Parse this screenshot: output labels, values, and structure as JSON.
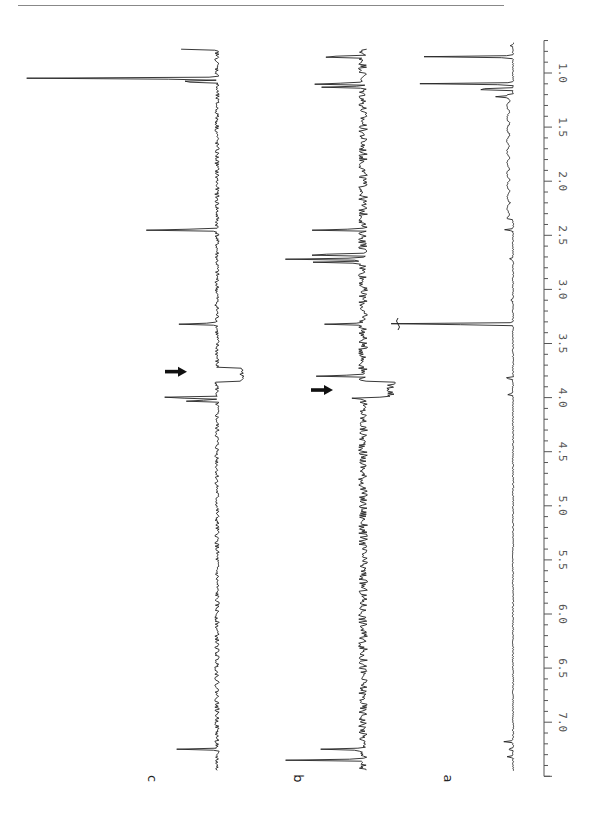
{
  "page": {
    "top_rule": true
  },
  "chart_data": {
    "type": "line",
    "title": "",
    "orientation": "rotated-90 (chemical shift runs top-to-bottom, intensity extends leftward)",
    "xlabel": "",
    "ylabel": "",
    "axis": {
      "unit": "ppm",
      "range": [
        0.7,
        7.5
      ],
      "major_ticks": [
        1.0,
        1.5,
        2.0,
        2.5,
        3.0,
        3.5,
        4.0,
        4.5,
        5.0,
        5.5,
        6.0,
        6.5,
        7.0
      ],
      "tick_labels": [
        "1.0",
        "1.5",
        "2.0",
        "2.5",
        "3.0",
        "3.5",
        "4.0",
        "4.5",
        "5.0",
        "5.5",
        "6.0",
        "6.5",
        "7.0"
      ],
      "minor_tick_step": 0.1
    },
    "grid": false,
    "legend": null,
    "series": [
      {
        "name": "a",
        "label": "a",
        "noise": "low",
        "peaks": [
          {
            "ppm": 0.75,
            "height": 0.02
          },
          {
            "ppm": 0.85,
            "height": 0.58
          },
          {
            "ppm": 1.1,
            "height": 0.62
          },
          {
            "ppm": 1.15,
            "height": 0.35
          },
          {
            "ppm": 1.22,
            "height": 0.08
          },
          {
            "ppm": 2.45,
            "height": 0.06
          },
          {
            "ppm": 2.72,
            "height": 0.03
          },
          {
            "ppm": 3.1,
            "height": 0.02
          },
          {
            "ppm": 3.32,
            "height": 1.0,
            "clipped": true
          },
          {
            "ppm": 3.82,
            "height": 0.06
          },
          {
            "ppm": 3.97,
            "height": 0.04
          },
          {
            "ppm": 7.18,
            "height": 0.06
          },
          {
            "ppm": 7.25,
            "height": 0.04
          },
          {
            "ppm": 7.32,
            "height": 0.04
          }
        ]
      },
      {
        "name": "b",
        "label": "b",
        "noise": "high",
        "peaks": [
          {
            "ppm": 0.85,
            "height": 0.55
          },
          {
            "ppm": 1.1,
            "height": 0.6
          },
          {
            "ppm": 1.13,
            "height": 0.4
          },
          {
            "ppm": 2.45,
            "height": 0.55
          },
          {
            "ppm": 2.68,
            "height": 0.7
          },
          {
            "ppm": 2.72,
            "height": 0.75
          },
          {
            "ppm": 2.75,
            "height": 0.45
          },
          {
            "ppm": 3.32,
            "height": 0.4
          },
          {
            "ppm": 3.8,
            "height": 0.45
          },
          {
            "ppm": 4.0,
            "height": 0.15
          },
          {
            "ppm": 7.25,
            "height": 0.4
          },
          {
            "ppm": 7.35,
            "height": 0.75
          }
        ],
        "negative_step": {
          "from_ppm": 3.85,
          "to_ppm": 4.0,
          "depth": 0.28
        },
        "arrow": {
          "ppm": 3.93,
          "direction": "right"
        }
      },
      {
        "name": "c",
        "label": "c",
        "noise": "medium",
        "peaks": [
          {
            "ppm": 0.78,
            "height": 0.18
          },
          {
            "ppm": 1.05,
            "height": 1.0
          },
          {
            "ppm": 1.08,
            "height": 0.25
          },
          {
            "ppm": 2.45,
            "height": 0.42
          },
          {
            "ppm": 3.32,
            "height": 0.2
          },
          {
            "ppm": 4.0,
            "height": 0.38
          },
          {
            "ppm": 4.03,
            "height": 0.2
          },
          {
            "ppm": 7.25,
            "height": 0.2
          }
        ],
        "negative_step": {
          "from_ppm": 3.72,
          "to_ppm": 3.85,
          "depth": 0.25
        },
        "arrow": {
          "ppm": 3.76,
          "direction": "right"
        }
      }
    ],
    "annotations": [
      {
        "type": "arrow",
        "trace": "c",
        "ppm": 3.76
      },
      {
        "type": "arrow",
        "trace": "b",
        "ppm": 3.93
      },
      {
        "type": "break-mark",
        "trace": "a",
        "ppm": 3.32
      }
    ]
  }
}
